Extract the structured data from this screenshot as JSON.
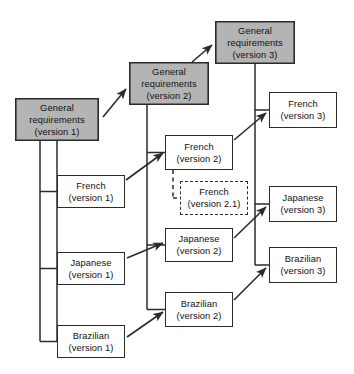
{
  "diagram": {
    "style": {
      "shaded_fill": "#b4b4b4",
      "plain_fill": "#ffffff",
      "stroke": "#2b2b2b",
      "background": "#ffffff"
    },
    "nodes": [
      {
        "id": "general-requirements-v1",
        "name": "general-requirements-version-1",
        "line1": "General",
        "line2": "requirements",
        "line3": "(version 1)",
        "shaded": true,
        "dashed": false,
        "x": 15,
        "y": 98,
        "w": 84,
        "h": 43
      },
      {
        "id": "general-requirements-v2",
        "name": "general-requirements-version-2",
        "line1": "General",
        "line2": "requirements",
        "line3": "(version 2)",
        "shaded": true,
        "dashed": false,
        "x": 129,
        "y": 62,
        "w": 80,
        "h": 43
      },
      {
        "id": "general-requirements-v3",
        "name": "general-requirements-version-3",
        "line1": "General",
        "line2": "requirements",
        "line3": "(version 3)",
        "shaded": true,
        "dashed": false,
        "x": 215,
        "y": 21,
        "w": 80,
        "h": 43
      },
      {
        "id": "french-v1",
        "name": "french-version-1",
        "line1": "French",
        "line2": "(version 1)",
        "shaded": false,
        "dashed": false,
        "x": 57,
        "y": 175,
        "w": 68,
        "h": 33
      },
      {
        "id": "japanese-v1",
        "name": "japanese-version-1",
        "line1": "Japanese",
        "line2": "(version 1)",
        "shaded": false,
        "dashed": false,
        "x": 57,
        "y": 252,
        "w": 68,
        "h": 33
      },
      {
        "id": "brazilian-v1",
        "name": "brazilian-version-1",
        "line1": "Brazilian",
        "line2": "(version 1)",
        "shaded": false,
        "dashed": false,
        "x": 57,
        "y": 325,
        "w": 68,
        "h": 33
      },
      {
        "id": "french-v2",
        "name": "french-version-2",
        "line1": "French",
        "line2": "(version 2)",
        "shaded": false,
        "dashed": false,
        "x": 165,
        "y": 135,
        "w": 68,
        "h": 35
      },
      {
        "id": "french-v21",
        "name": "french-version-2-1",
        "line1": "French",
        "line2": "(version 2.1)",
        "shaded": false,
        "dashed": true,
        "x": 180,
        "y": 181,
        "w": 68,
        "h": 34
      },
      {
        "id": "japanese-v2",
        "name": "japanese-version-2",
        "line1": "Japanese",
        "line2": "(version 2)",
        "shaded": false,
        "dashed": false,
        "x": 165,
        "y": 228,
        "w": 68,
        "h": 34
      },
      {
        "id": "brazilian-v2",
        "name": "brazilian-version-2",
        "line1": "Brazilian",
        "line2": "(version 2)",
        "shaded": false,
        "dashed": false,
        "x": 165,
        "y": 292,
        "w": 68,
        "h": 35
      },
      {
        "id": "french-v3",
        "name": "french-version-3",
        "line1": "French",
        "line2": "(version 3)",
        "shaded": false,
        "dashed": false,
        "x": 269,
        "y": 92,
        "w": 68,
        "h": 36
      },
      {
        "id": "japanese-v3",
        "name": "japanese-version-3",
        "line1": "Japanese",
        "line2": "(version 3)",
        "shaded": false,
        "dashed": false,
        "x": 269,
        "y": 186,
        "w": 68,
        "h": 36
      },
      {
        "id": "brazilian-v3",
        "name": "brazilian-version-3",
        "line1": "Brazilian",
        "line2": "(version 3)",
        "shaded": false,
        "dashed": false,
        "x": 269,
        "y": 247,
        "w": 68,
        "h": 36
      }
    ],
    "edges": [
      {
        "name": "edge-general-v1-to-general-v2",
        "kind": "arrow",
        "from": "general-requirements-v1",
        "to": "general-requirements-v2"
      },
      {
        "name": "edge-general-v2-to-general-v3",
        "kind": "arrow",
        "from": "general-requirements-v2",
        "to": "general-requirements-v3"
      },
      {
        "name": "edge-general-v1-trunk-to-french-v1",
        "kind": "tree",
        "from": "general-requirements-v1",
        "to": "french-v1"
      },
      {
        "name": "edge-general-v1-trunk-to-japanese-v1",
        "kind": "tree",
        "from": "general-requirements-v1",
        "to": "japanese-v1"
      },
      {
        "name": "edge-general-v1-trunk-to-brazilian-v1",
        "kind": "tree",
        "from": "general-requirements-v1",
        "to": "brazilian-v1"
      },
      {
        "name": "edge-general-v2-trunk-to-french-v2",
        "kind": "tree",
        "from": "general-requirements-v2",
        "to": "french-v2"
      },
      {
        "name": "edge-general-v2-trunk-to-japanese-v2",
        "kind": "tree",
        "from": "general-requirements-v2",
        "to": "japanese-v2"
      },
      {
        "name": "edge-general-v2-trunk-to-brazilian-v2",
        "kind": "tree",
        "from": "general-requirements-v2",
        "to": "brazilian-v2"
      },
      {
        "name": "edge-general-v3-trunk-to-french-v3",
        "kind": "tree",
        "from": "general-requirements-v3",
        "to": "french-v3"
      },
      {
        "name": "edge-general-v3-trunk-to-japanese-v3",
        "kind": "tree",
        "from": "general-requirements-v3",
        "to": "japanese-v3"
      },
      {
        "name": "edge-general-v3-trunk-to-brazilian-v3",
        "kind": "tree",
        "from": "general-requirements-v3",
        "to": "brazilian-v3"
      },
      {
        "name": "edge-french-v1-to-french-v2",
        "kind": "arrow",
        "from": "french-v1",
        "to": "french-v2"
      },
      {
        "name": "edge-japanese-v1-to-japanese-v2",
        "kind": "arrow",
        "from": "japanese-v1",
        "to": "japanese-v2"
      },
      {
        "name": "edge-brazilian-v1-to-brazilian-v2",
        "kind": "arrow",
        "from": "brazilian-v1",
        "to": "brazilian-v2"
      },
      {
        "name": "edge-french-v2-to-french-v3",
        "kind": "arrow",
        "from": "french-v2",
        "to": "french-v3"
      },
      {
        "name": "edge-japanese-v2-to-japanese-v3",
        "kind": "arrow",
        "from": "japanese-v2",
        "to": "japanese-v3"
      },
      {
        "name": "edge-brazilian-v2-to-brazilian-v3",
        "kind": "arrow",
        "from": "brazilian-v2",
        "to": "brazilian-v3"
      },
      {
        "name": "edge-french-v2-to-french-v2-1-dashed",
        "kind": "dashed-tree",
        "from": "french-v2",
        "to": "french-v21"
      }
    ]
  }
}
